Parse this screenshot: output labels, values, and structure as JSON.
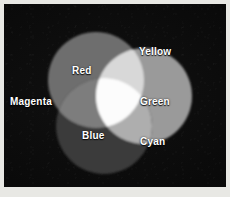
{
  "figure": {
    "background_color": "#0a0a0a",
    "border_color": "#e8e8e4",
    "rendering": "grayscale"
  },
  "diagram": {
    "type": "venn-3-circle",
    "circles": [
      {
        "id": "red",
        "label": "Red",
        "cx": 92,
        "cy": 76,
        "r": 48,
        "gray_hex": "#6e6e6e",
        "true_color_hex": "#ff0000",
        "label_position": "inside-upper-left"
      },
      {
        "id": "green",
        "label": "Green",
        "cx": 140,
        "cy": 92,
        "r": 48,
        "gray_hex": "#9a9a9a",
        "true_color_hex": "#00ff00",
        "label_position": "inside-right"
      },
      {
        "id": "blue",
        "label": "Blue",
        "cx": 100,
        "cy": 122,
        "r": 48,
        "gray_hex": "#3a3a3a",
        "true_color_hex": "#0000ff",
        "label_position": "inside-lower-left"
      }
    ],
    "overlaps": [
      {
        "id": "yellow",
        "label": "Yellow",
        "sources": [
          "red",
          "green"
        ],
        "gray_hex": "#d8d8d8",
        "true_color_hex": "#ffff00",
        "label_position": "outside-top-right"
      },
      {
        "id": "magenta",
        "label": "Magenta",
        "sources": [
          "red",
          "blue"
        ],
        "gray_hex": "#7d7d7d",
        "true_color_hex": "#ff00ff",
        "label_position": "outside-left"
      },
      {
        "id": "cyan",
        "label": "Cyan",
        "sources": [
          "green",
          "blue"
        ],
        "gray_hex": "#aeaeae",
        "true_color_hex": "#00ffff",
        "label_position": "outside-bottom-right"
      },
      {
        "id": "white",
        "label": "",
        "sources": [
          "red",
          "green",
          "blue"
        ],
        "gray_hex": "#fcfcfc",
        "true_color_hex": "#ffffff",
        "label_position": "center"
      }
    ],
    "labels": {
      "red": "Red",
      "yellow": "Yellow",
      "magenta": "Magenta",
      "green": "Green",
      "blue": "Blue",
      "cyan": "Cyan"
    },
    "label_color": "#ffffff"
  }
}
